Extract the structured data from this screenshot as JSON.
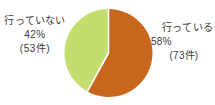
{
  "chart_data": {
    "type": "pie",
    "title": "",
    "legend_position": "labels-outside",
    "categories": [
      "行っている",
      "行っていない"
    ],
    "values": [
      58,
      42
    ],
    "counts": [
      73,
      53
    ],
    "unit_suffix": "件",
    "percent_suffix": "%",
    "total_count": 126,
    "colors": [
      "#c8671c",
      "#c3dd6e"
    ],
    "start_angle_deg": 0,
    "direction": "clockwise",
    "slices": [
      {
        "name": "行っている",
        "percent_label": "58%",
        "count_label": "(73件)",
        "value": 58,
        "count": 73,
        "color": "#c8671c",
        "start_angle_deg": 0,
        "end_angle_deg": 208.8
      },
      {
        "name": "行っていない",
        "percent_label": "42%",
        "count_label": "(53件)",
        "value": 42,
        "count": 53,
        "color": "#c3dd6e",
        "start_angle_deg": 208.8,
        "end_angle_deg": 360
      }
    ]
  },
  "labels": {
    "no": {
      "name": "行っていない",
      "percent": "42%",
      "count": "(53件)"
    },
    "yes": {
      "name": "行っている",
      "percent": "58%",
      "count": "(73件)"
    }
  },
  "style": {
    "background": "#ffffff",
    "text_color": "#3a3a38",
    "slice_gap_color": "#ffffff",
    "orange": "#c8671c",
    "green": "#c3dd6e"
  }
}
